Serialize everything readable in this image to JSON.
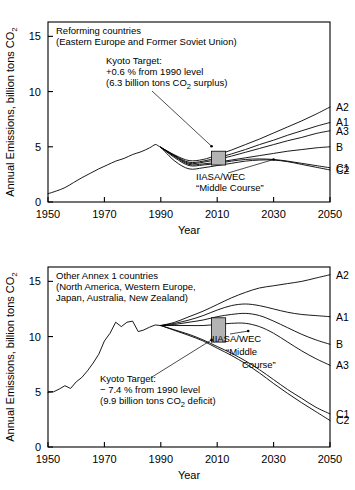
{
  "figure": {
    "axis": {
      "xlabel": "Year",
      "ylabel": "Annual Emissions, billion tons CO",
      "ylabel_sub": "2",
      "xticks": [
        "1950",
        "1970",
        "1990",
        "2010",
        "2030",
        "2050"
      ],
      "xtick_values": [
        1950,
        1970,
        1990,
        2010,
        2030,
        2050
      ],
      "yticks": [
        "0",
        "5",
        "10",
        "15"
      ],
      "ytick_values": [
        0,
        5,
        10,
        15
      ],
      "xlim": [
        1950,
        2050
      ],
      "ylim": [
        0,
        16.3
      ],
      "grid": false
    }
  },
  "chart_data": [
    {
      "type": "line",
      "panel": "top",
      "title": "Reforming countries",
      "subtitle": "(Eastern Europe and Former Soviet Union)",
      "xlabel": "Year",
      "ylabel": "Annual Emissions, billion tons CO2",
      "xlim": [
        1950,
        2050
      ],
      "ylim": [
        0,
        16.3
      ],
      "grid": false,
      "legend_position": "right-of-axis",
      "annotations": [
        {
          "name": "kyoto-target",
          "lines": [
            "Kyoto Target:",
            "+0.6 % from 1990 level",
            "(6.3 billion tons CO2 surplus)"
          ],
          "line1": "Kyoto Target:",
          "line2_pre": "+0.6 % from 1990 level",
          "line3_pre": "(6.3 billion tons CO",
          "line3_sub": "2",
          "line3_post": " surplus)",
          "points_to": {
            "x": 2008,
            "y": 5.05
          }
        },
        {
          "name": "iiasa-wec-middle-course",
          "line1": "IIASA/WEC",
          "line2": "“Middle Course”",
          "points_to": {
            "x": 2030,
            "y": 3.85
          }
        }
      ],
      "kyoto_box": {
        "x0": 2008,
        "x1": 2013,
        "y0": 3.35,
        "y1": 4.6
      },
      "historical": {
        "name": "Historical emissions",
        "x": [
          1950,
          1953,
          1956,
          1959,
          1962,
          1965,
          1968,
          1971,
          1974,
          1977,
          1980,
          1983,
          1986,
          1988,
          1989,
          1990
        ],
        "y": [
          0.75,
          1.0,
          1.3,
          1.75,
          2.2,
          2.6,
          3.0,
          3.35,
          3.7,
          3.95,
          4.3,
          4.55,
          4.9,
          5.2,
          5.1,
          4.95
        ]
      },
      "series": [
        {
          "name": "A2",
          "label": "A2",
          "label_y": 8.6,
          "x": [
            1990,
            1995,
            2000,
            2005,
            2010,
            2015,
            2020,
            2025,
            2030,
            2035,
            2040,
            2045,
            2050
          ],
          "y": [
            4.95,
            4.25,
            3.75,
            3.85,
            4.25,
            4.7,
            5.2,
            5.7,
            6.25,
            6.8,
            7.35,
            7.95,
            8.6
          ]
        },
        {
          "name": "A1",
          "label": "A1",
          "label_y": 7.2,
          "x": [
            1990,
            1995,
            2000,
            2005,
            2010,
            2015,
            2020,
            2025,
            2030,
            2035,
            2040,
            2045,
            2050
          ],
          "y": [
            4.95,
            4.2,
            3.6,
            3.7,
            4.0,
            4.35,
            4.75,
            5.2,
            5.6,
            6.05,
            6.45,
            6.85,
            7.2
          ]
        },
        {
          "name": "A3",
          "label": "A3",
          "label_y": 6.45,
          "x": [
            1990,
            1995,
            2000,
            2005,
            2010,
            2015,
            2020,
            2025,
            2030,
            2035,
            2040,
            2045,
            2050
          ],
          "y": [
            4.95,
            4.15,
            3.5,
            3.6,
            3.85,
            4.15,
            4.5,
            4.85,
            5.2,
            5.55,
            5.85,
            6.2,
            6.45
          ]
        },
        {
          "name": "B",
          "label": "B",
          "label_y": 5.0,
          "x": [
            1990,
            1995,
            2000,
            2005,
            2010,
            2015,
            2020,
            2025,
            2030,
            2035,
            2040,
            2045,
            2050
          ],
          "y": [
            4.95,
            4.1,
            3.4,
            3.45,
            3.6,
            3.8,
            4.0,
            4.2,
            4.4,
            4.6,
            4.75,
            4.9,
            5.0
          ]
        },
        {
          "name": "C1",
          "label": "C1",
          "label_y": 3.1,
          "x": [
            1990,
            1995,
            2000,
            2005,
            2010,
            2015,
            2020,
            2025,
            2030,
            2035,
            2040,
            2045,
            2050
          ],
          "y": [
            4.95,
            4.0,
            3.3,
            3.35,
            3.5,
            3.7,
            3.85,
            3.9,
            3.85,
            3.7,
            3.5,
            3.3,
            3.1
          ]
        },
        {
          "name": "C2",
          "label": "C2",
          "label_y": 2.9,
          "x": [
            1990,
            1995,
            2000,
            2005,
            2010,
            2015,
            2020,
            2025,
            2030,
            2035,
            2040,
            2045,
            2050
          ],
          "y": [
            4.95,
            3.7,
            3.0,
            3.1,
            3.3,
            3.5,
            3.7,
            3.8,
            3.8,
            3.65,
            3.4,
            3.15,
            2.9
          ]
        }
      ]
    },
    {
      "type": "line",
      "panel": "bottom",
      "title": "Other Annex 1 countries",
      "subtitle": "(North America, Western Europe,",
      "subtitle2": "Japan, Australia, New Zealand)",
      "xlabel": "Year",
      "ylabel": "Annual Emissions, billion tons CO2",
      "xlim": [
        1950,
        2050
      ],
      "ylim": [
        0,
        16.3
      ],
      "grid": false,
      "legend_position": "right-of-axis",
      "annotations": [
        {
          "name": "kyoto-target",
          "line1": "Kyoto Target:",
          "line2_pre": "− 7.4 % from 1990 level",
          "line3_pre": "(9.9 billion tons CO",
          "line3_sub": "2",
          "line3_post": " deficit)",
          "points_to": {
            "x": 2008,
            "y": 9.7
          }
        },
        {
          "name": "iiasa-wec-middle-course",
          "line1": "IIASA/WEC",
          "line2": "“Middle",
          "line3": "Course”",
          "points_to": {
            "x": 2021,
            "y": 10.5
          }
        }
      ],
      "kyoto_box": {
        "x0": 2008,
        "x1": 2013,
        "y0": 9.5,
        "y1": 11.7
      },
      "historical": {
        "name": "Historical emissions",
        "x": [
          1950,
          1952,
          1954,
          1956,
          1958,
          1960,
          1962,
          1964,
          1966,
          1968,
          1970,
          1972,
          1974,
          1976,
          1978,
          1980,
          1982,
          1984,
          1986,
          1988,
          1990
        ],
        "y": [
          4.95,
          5.0,
          5.25,
          5.55,
          5.3,
          5.9,
          6.3,
          6.9,
          7.6,
          8.4,
          9.6,
          10.3,
          11.3,
          10.9,
          11.3,
          11.4,
          10.45,
          10.6,
          10.85,
          11.05,
          11.0
        ]
      },
      "series": [
        {
          "name": "A2",
          "label": "A2",
          "label_y": 15.6,
          "x": [
            1990,
            1995,
            2000,
            2005,
            2010,
            2015,
            2020,
            2025,
            2030,
            2035,
            2040,
            2045,
            2050
          ],
          "y": [
            11.0,
            11.3,
            11.8,
            12.3,
            12.9,
            13.5,
            14.0,
            14.4,
            14.6,
            14.8,
            15.0,
            15.3,
            15.6
          ]
        },
        {
          "name": "A1",
          "label": "A1",
          "label_y": 11.8,
          "x": [
            1990,
            1995,
            2000,
            2005,
            2010,
            2015,
            2020,
            2025,
            2030,
            2035,
            2040,
            2045,
            2050
          ],
          "y": [
            11.0,
            11.2,
            11.5,
            11.9,
            12.4,
            12.8,
            12.95,
            12.8,
            12.5,
            12.2,
            12.0,
            11.9,
            11.8
          ]
        },
        {
          "name": "B",
          "label": "B",
          "label_y": 9.3,
          "x": [
            1990,
            1995,
            2000,
            2005,
            2010,
            2015,
            2020,
            2025,
            2030,
            2035,
            2040,
            2045,
            2050
          ],
          "y": [
            11.0,
            11.1,
            11.3,
            11.5,
            11.8,
            12.0,
            12.1,
            11.9,
            11.4,
            10.8,
            10.2,
            9.7,
            9.3
          ]
        },
        {
          "name": "A3",
          "label": "A3",
          "label_y": 7.4,
          "x": [
            1990,
            1995,
            2000,
            2005,
            2010,
            2015,
            2020,
            2025,
            2030,
            2035,
            2040,
            2045,
            2050
          ],
          "y": [
            11.0,
            11.0,
            11.0,
            11.0,
            11.1,
            11.2,
            11.2,
            10.9,
            10.3,
            9.5,
            8.7,
            8.0,
            7.4
          ]
        },
        {
          "name": "C1",
          "label": "C1",
          "label_y": 3.0,
          "x": [
            1990,
            1995,
            2000,
            2005,
            2010,
            2015,
            2020,
            2025,
            2030,
            2035,
            2040,
            2045,
            2050
          ],
          "y": [
            11.0,
            10.6,
            10.2,
            9.7,
            9.1,
            8.5,
            7.8,
            7.0,
            6.1,
            5.2,
            4.4,
            3.6,
            3.0
          ]
        },
        {
          "name": "C2",
          "label": "C2",
          "label_y": 2.4,
          "x": [
            1990,
            1995,
            2000,
            2005,
            2010,
            2015,
            2020,
            2025,
            2030,
            2035,
            2040,
            2045,
            2050
          ],
          "y": [
            11.0,
            10.55,
            10.1,
            9.6,
            8.95,
            8.3,
            7.55,
            6.7,
            5.75,
            4.85,
            4.0,
            3.2,
            2.4
          ]
        }
      ]
    }
  ]
}
